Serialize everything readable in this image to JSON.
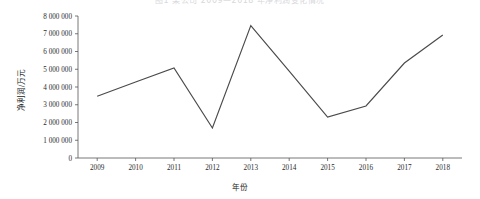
{
  "chart_data": {
    "type": "line",
    "title": "图1 某公司 2009—2018 年净利润变化情况",
    "xlabel": "年份",
    "ylabel": "净利润/万元",
    "categories": [
      "2009",
      "2010",
      "2011",
      "2012",
      "2013",
      "2014",
      "2015",
      "2016",
      "2017",
      "2018"
    ],
    "x_tick_labels": [
      "2009",
      "2010",
      "2011",
      "2012",
      "2013",
      "2014",
      "2015",
      "2016",
      "2017",
      "2018"
    ],
    "y_tick_labels": [
      "0",
      "1 000 000",
      "2 000 000",
      "3 000 000",
      "4 000 000",
      "5 000 000",
      "6 000 000",
      "7 000 000",
      "8 000 000"
    ],
    "y_tick_values": [
      0,
      1000000,
      2000000,
      3000000,
      4000000,
      5000000,
      6000000,
      7000000,
      8000000
    ],
    "ylim": [
      0,
      8000000
    ],
    "values": [
      3480000,
      4280000,
      5070000,
      1690000,
      7460000,
      4900000,
      2310000,
      2930000,
      5350000,
      6930000
    ],
    "series": [
      {
        "name": "净利润",
        "values": [
          3480000,
          4280000,
          5070000,
          1690000,
          7460000,
          4900000,
          2310000,
          2930000,
          5350000,
          6930000
        ]
      }
    ],
    "grid": false,
    "legend": false,
    "legend_position": "none",
    "line_color": "#4a4a4a",
    "axis_color": "#555555",
    "background_color": "#ffffff"
  }
}
